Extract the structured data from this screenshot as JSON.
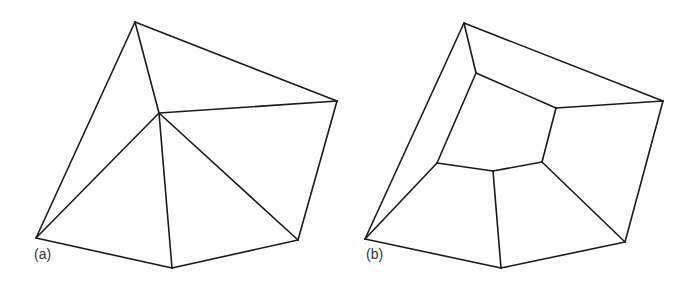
{
  "figure": {
    "panels": [
      {
        "id": "a",
        "label": "(a)",
        "label_pos": [
          34,
          246
        ],
        "description": "Triangulation of a pentagon with one interior vertex",
        "vertices": {
          "top": [
            135,
            22
          ],
          "right": [
            337,
            101
          ],
          "center": [
            159,
            113
          ],
          "bottom_left": [
            36,
            238
          ],
          "bottom_mid": [
            172,
            268
          ],
          "bottom_right": [
            298,
            240
          ]
        },
        "edges": [
          [
            "top",
            "right"
          ],
          [
            "right",
            "bottom_right"
          ],
          [
            "bottom_right",
            "bottom_mid"
          ],
          [
            "bottom_mid",
            "bottom_left"
          ],
          [
            "bottom_left",
            "top"
          ],
          [
            "center",
            "top"
          ],
          [
            "center",
            "right"
          ],
          [
            "center",
            "bottom_right"
          ],
          [
            "center",
            "bottom_mid"
          ],
          [
            "center",
            "bottom_left"
          ]
        ]
      },
      {
        "id": "b",
        "label": "(b)",
        "label_pos": [
          366,
          246
        ],
        "description": "Dual / quad subdivision of the pentagon with inner pentagon",
        "vertices": {
          "top": [
            464,
            23
          ],
          "right": [
            663,
            101
          ],
          "bottom_left": [
            365,
            239
          ],
          "bottom_mid": [
            501,
            268
          ],
          "bottom_right": [
            625,
            242
          ],
          "inner_top": [
            476,
            73
          ],
          "inner_right": [
            556,
            108
          ],
          "inner_bottom_right": [
            542,
            162
          ],
          "inner_bottom_mid": [
            493,
            171
          ],
          "inner_left": [
            437,
            163
          ]
        },
        "edges": [
          [
            "top",
            "right"
          ],
          [
            "right",
            "bottom_right"
          ],
          [
            "bottom_right",
            "bottom_mid"
          ],
          [
            "bottom_mid",
            "bottom_left"
          ],
          [
            "bottom_left",
            "top"
          ],
          [
            "inner_top",
            "inner_right"
          ],
          [
            "inner_right",
            "inner_bottom_right"
          ],
          [
            "inner_bottom_right",
            "inner_bottom_mid"
          ],
          [
            "inner_bottom_mid",
            "inner_left"
          ],
          [
            "inner_left",
            "inner_top"
          ],
          [
            "top",
            "inner_top"
          ],
          [
            "right",
            "inner_right"
          ],
          [
            "bottom_right",
            "inner_bottom_right"
          ],
          [
            "bottom_mid",
            "inner_bottom_mid"
          ],
          [
            "bottom_left",
            "inner_left"
          ]
        ]
      }
    ],
    "colors": {
      "stroke": "#1a1a1a",
      "background": "#ffffff",
      "label": "#333333"
    }
  }
}
